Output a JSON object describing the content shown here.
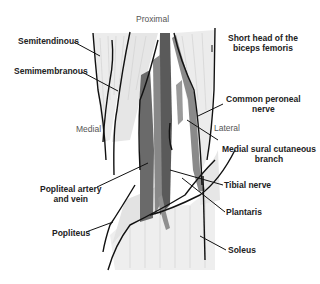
{
  "diagram": {
    "orientation": {
      "top": "Proximal",
      "left": "Medial",
      "right": "Lateral"
    },
    "labels": {
      "semitendinous": "Semitendinous",
      "semimembranous": "Semimembranous",
      "short_head_line1": "Short head of the",
      "short_head_line2": "biceps femoris",
      "common_peroneal_line1": "Common peroneal",
      "common_peroneal_line2": "nerve",
      "medial_sural_line1": "Medial sural cutaneous",
      "medial_sural_line2": "branch",
      "popliteal_line1": "Popliteal artery",
      "popliteal_line2": "and vein",
      "tibial_nerve": "Tibial nerve",
      "plantaris": "Plantaris",
      "popliteus": "Popliteus",
      "soleus": "Soleus"
    },
    "colors": {
      "outline": "#111111",
      "vessel_dark": "#555555",
      "vessel_mid": "#808080",
      "muscle_light": "#e4e4e4",
      "background": "#ffffff"
    }
  }
}
